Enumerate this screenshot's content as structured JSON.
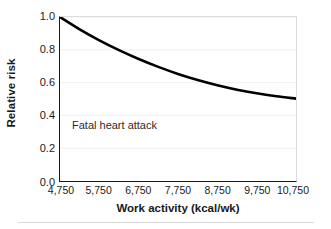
{
  "chart_data": {
    "type": "line",
    "title": "",
    "xlabel": "Work activity (kcal/wk)",
    "ylabel": "Relative risk",
    "xlim": [
      4750,
      10750
    ],
    "ylim": [
      0.0,
      1.0
    ],
    "grid": "horizontal-faint",
    "legend": "none",
    "annotations": [
      {
        "text": "Fatal heart attack",
        "x": 5500,
        "y": 0.3
      }
    ],
    "x_ticks": [
      4750,
      5750,
      6750,
      7750,
      8750,
      9750,
      10750
    ],
    "x_tick_labels": [
      "4,750",
      "5,750",
      "6,750",
      "7,750",
      "8,750",
      "9,750",
      "10,750"
    ],
    "y_ticks": [
      0.0,
      0.2,
      0.4,
      0.6,
      0.8,
      1.0
    ],
    "y_tick_labels": [
      "0.0",
      "0.2",
      "0.4",
      "0.6",
      "0.8",
      "1.0"
    ],
    "series": [
      {
        "name": "Relative risk of fatal heart attack",
        "color": "#000000",
        "x": [
          4750,
          5250,
          5750,
          6250,
          6750,
          7250,
          7750,
          8250,
          8750,
          9250,
          9750,
          10250,
          10750
        ],
        "values": [
          1.0,
          0.925,
          0.858,
          0.798,
          0.744,
          0.696,
          0.653,
          0.616,
          0.584,
          0.557,
          0.535,
          0.517,
          0.502
        ]
      }
    ]
  },
  "axis": {
    "y_title": "Relative risk",
    "x_title": "Work activity (kcal/wk)"
  },
  "annotation": {
    "fatal_heart_attack": "Fatal heart attack"
  },
  "colors": {
    "curve": "#000000",
    "axis": "#1a1a1a",
    "frame_light": "#dcdcdc",
    "gridline": "#f0f0f0",
    "background": "#ffffff"
  }
}
